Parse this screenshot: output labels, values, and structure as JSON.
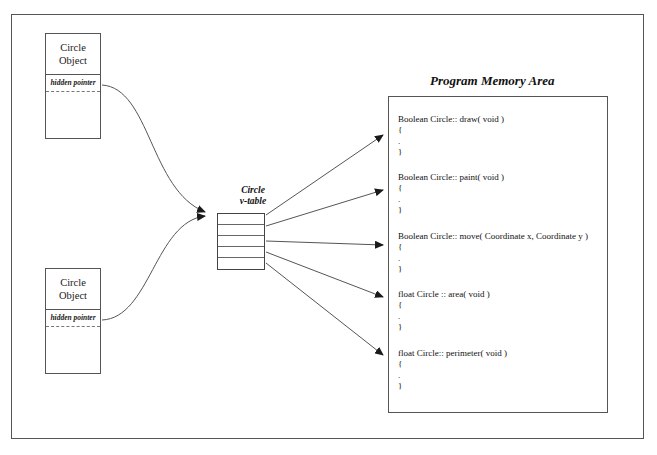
{
  "diagram": {
    "title_memory_area": "Program Memory Area",
    "vtable_label_line1": "Circle",
    "vtable_label_line2": "v-table",
    "objects": [
      {
        "title_line1": "Circle",
        "title_line2": "Object",
        "pointer_label": "hidden pointer"
      },
      {
        "title_line1": "Circle",
        "title_line2": "Object",
        "pointer_label": "hidden pointer"
      }
    ],
    "vtable_slots": [
      "",
      "",
      "",
      "",
      ""
    ],
    "methods": [
      {
        "signature": "Boolean Circle:: draw( void )",
        "open": "{",
        "dot": ".",
        "close": "}"
      },
      {
        "signature": "Boolean Circle:: paint( void )",
        "open": "{",
        "dot": ".",
        "close": "}"
      },
      {
        "signature": "Boolean Circle:: move( Coordinate x, Coordinate  y )",
        "open": "{",
        "dot": ".",
        "close": "}"
      },
      {
        "signature": "float Circle :: area( void )",
        "open": "{",
        "dot": ".",
        "close": "}"
      },
      {
        "signature": "float Circle:: perimeter( void )",
        "open": "{",
        "dot": ".",
        "close": "}"
      }
    ],
    "colors": {
      "line": "#555555",
      "arrow": "#1a1a1a",
      "text": "#111111",
      "background": "#ffffff"
    }
  }
}
